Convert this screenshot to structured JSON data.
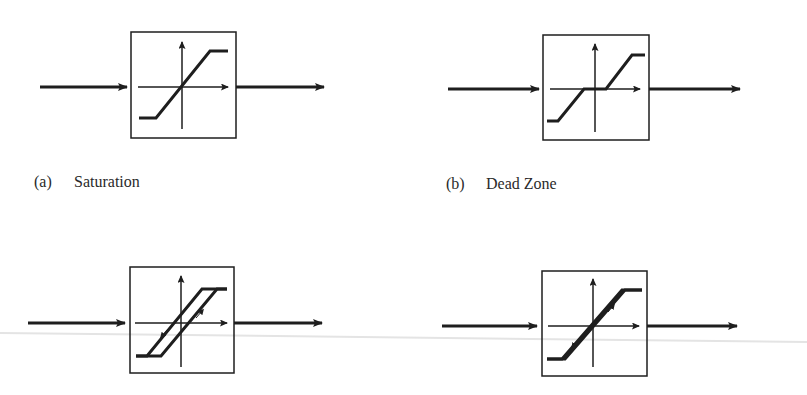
{
  "figure": {
    "panels": [
      {
        "id": "a",
        "tag": "(a)",
        "label": "Saturation",
        "characteristic": "saturation"
      },
      {
        "id": "b",
        "tag": "(b)",
        "label": "Dead Zone",
        "characteristic": "dead-zone"
      },
      {
        "id": "c",
        "tag": "",
        "label": "",
        "characteristic": "hysteresis"
      },
      {
        "id": "d",
        "tag": "",
        "label": "",
        "characteristic": "hysteresis-narrow"
      }
    ]
  },
  "colors": {
    "ink": "#1e1e1e",
    "caption": "#2a2a2a",
    "scan_line": "#e4e4e4",
    "background": "#ffffff"
  }
}
